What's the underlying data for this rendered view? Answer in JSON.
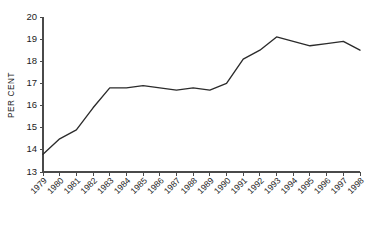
{
  "chart_data": {
    "type": "line",
    "title": "",
    "xlabel": "",
    "ylabel": "PER CENT",
    "ylim": [
      13,
      20
    ],
    "yticks": [
      13,
      14,
      15,
      16,
      17,
      18,
      19,
      20
    ],
    "grid": false,
    "legend": null,
    "line_color": "#2b2b2b",
    "axis_color": "#4a4a4a",
    "categories": [
      "1979",
      "1980",
      "1981",
      "1982",
      "1983",
      "1984",
      "1985",
      "1986",
      "1987",
      "1988",
      "1989",
      "1990",
      "1991",
      "1992",
      "1993",
      "1994",
      "1995",
      "1996",
      "1997",
      "1998"
    ],
    "values": [
      13.8,
      14.5,
      14.9,
      15.9,
      16.8,
      16.8,
      16.9,
      16.8,
      16.7,
      16.8,
      16.7,
      17.0,
      18.1,
      18.5,
      19.1,
      18.9,
      18.7,
      18.8,
      18.9,
      18.5
    ],
    "series": [
      {
        "name": "per cent",
        "values": [
          13.8,
          14.5,
          14.9,
          15.9,
          16.8,
          16.8,
          16.9,
          16.8,
          16.7,
          16.8,
          16.7,
          17.0,
          18.1,
          18.5,
          19.1,
          18.9,
          18.7,
          18.8,
          18.9,
          18.5
        ]
      }
    ]
  },
  "plot": {
    "left": 43,
    "right": 360,
    "top": 17,
    "bottom": 172,
    "xtick_label_rotation": -45
  }
}
